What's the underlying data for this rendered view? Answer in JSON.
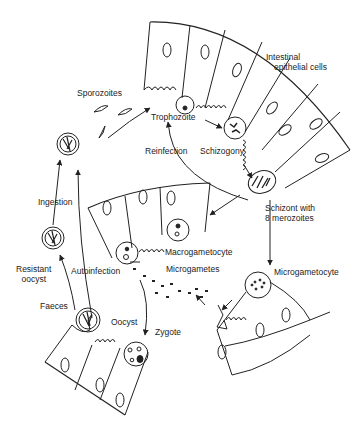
{
  "diagram": {
    "type": "life-cycle",
    "labels": {
      "intestinal_cells": [
        "Intestinal",
        "epithelial cells"
      ],
      "sporozoites": "Sporozoites",
      "trophozoite": "Trophozoite",
      "reinfection": "Reinfection",
      "schizogony": "Schizogony",
      "schizont": [
        "Schizont with",
        "8 merozoites"
      ],
      "ingestion": "Ingestion",
      "macrogametocyte": "Macrogametocyte",
      "microgametes": "Microgametes",
      "microgametocyte": "Microgametocyte",
      "resistant_oocyst": [
        "Resistant",
        "oocyst"
      ],
      "autoinfection": "Autoinfection",
      "faeces": "Faeces",
      "oocyst": "Oocyst",
      "zygote": "Zygote"
    },
    "stages": [
      "Sporozoites",
      "Trophozoite",
      "Schizogony",
      "Schizont with 8 merozoites",
      "Macrogametocyte",
      "Microgametocyte",
      "Microgametes",
      "Zygote",
      "Oocyst",
      "Faeces",
      "Resistant oocyst",
      "Ingestion"
    ],
    "colors": {
      "ink": "#222222",
      "background": "#ffffff"
    }
  }
}
